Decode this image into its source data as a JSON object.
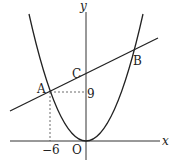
{
  "diagram": {
    "axes": {
      "x_label": "x",
      "y_label": "y",
      "origin_label": "O"
    },
    "points": {
      "A": {
        "label": "A",
        "x": -6,
        "y": 9
      },
      "B": {
        "label": "B"
      },
      "C": {
        "label": "C"
      }
    },
    "ticks": {
      "x_tick": "−6",
      "y_tick": "9"
    },
    "curves": [
      {
        "type": "parabola",
        "description": "y = a x^2 through O and A(-6, 9)"
      },
      {
        "type": "line",
        "description": "line through A, C, B"
      }
    ],
    "colors": {
      "stroke": "#222222",
      "dashed": "#444444"
    }
  }
}
